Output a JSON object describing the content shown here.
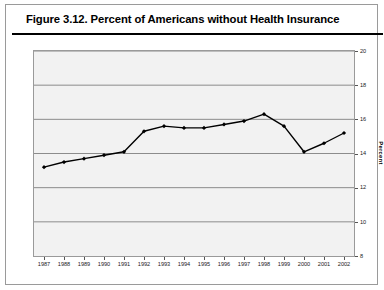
{
  "figure": {
    "title": "Figure 3.12.  Percent of Americans without Health Insurance"
  },
  "chart_data": {
    "type": "line",
    "title": "Figure 3.12.  Percent of Americans without Health Insurance",
    "xlabel": "",
    "ylabel": "Percent",
    "categories": [
      "1987",
      "1988",
      "1989",
      "1990",
      "1991",
      "1992",
      "1993",
      "1994",
      "1995",
      "1996",
      "1997",
      "1998",
      "1999",
      "2000",
      "2001",
      "2002"
    ],
    "values": [
      13.2,
      13.5,
      13.7,
      13.9,
      14.1,
      15.3,
      15.6,
      15.5,
      15.5,
      15.7,
      15.9,
      16.3,
      15.6,
      14.1,
      14.6,
      15.2
    ],
    "series": [
      {
        "name": "Percent without health insurance",
        "values": [
          13.2,
          13.5,
          13.7,
          13.9,
          14.1,
          15.3,
          15.6,
          15.5,
          15.5,
          15.7,
          15.9,
          16.3,
          15.6,
          14.1,
          14.6,
          15.2
        ]
      }
    ],
    "ylim": [
      8,
      20
    ],
    "yticks": [
      8,
      10,
      12,
      14,
      16,
      18,
      20
    ],
    "ytick_labels": [
      "8",
      "10",
      "12",
      "14",
      "16",
      "18",
      "20"
    ],
    "xtick_labels": [
      "1987",
      "1988",
      "1989",
      "1990",
      "1991",
      "1992",
      "1993",
      "1994",
      "1995",
      "1996",
      "1997",
      "1998",
      "1999",
      "2000",
      "2001",
      "2002"
    ],
    "grid": true,
    "grid_axis": "y",
    "legend": false,
    "legend_position": "none",
    "marker": "diamond",
    "line_color": "#000000",
    "marker_color": "#000000",
    "plot_background": "#f2f2f2",
    "grid_color": "#808080",
    "axis_position": "right"
  }
}
